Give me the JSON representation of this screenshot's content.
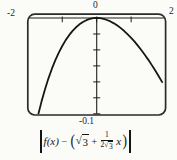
{
  "colors": {
    "ink": "#1f1f1f",
    "frame": "#2a2a2a",
    "background": "#fbfbf8"
  },
  "window_labels": {
    "top_left": "-2",
    "top_center": "0",
    "top_right": "2",
    "bottom": "-0.1"
  },
  "caption": {
    "bar": "|",
    "f_term": "f(x)",
    "minus": "−",
    "lparen": "(",
    "radical": "√",
    "radicand": "3",
    "plus": "+",
    "frac_num": "1",
    "frac_den_coeff": "2",
    "frac_den_radical": "√",
    "frac_den_radicand": "3",
    "x_var": "x",
    "rparen": ")"
  },
  "chart_data": {
    "type": "line",
    "xlabel": "",
    "ylabel": "",
    "xlim": [
      -2,
      2
    ],
    "ylim": [
      -0.1,
      0
    ],
    "grid": false,
    "legend_position": "none",
    "x_ticks": [
      -1,
      0,
      1
    ],
    "x_tick_labels_shown": [
      "-2",
      "0",
      "2"
    ],
    "y_tick_labels_shown": [
      "-0.1"
    ],
    "y_ticks": [
      -0.0167,
      -0.0333,
      -0.05,
      -0.0667,
      -0.0833,
      -0.1
    ],
    "series": [
      {
        "name": "error-curve",
        "x": [
          -1.7,
          -1.6,
          -1.5,
          -1.4,
          -1.3,
          -1.2,
          -1.1,
          -1.0,
          -0.9,
          -0.8,
          -0.7,
          -0.6,
          -0.5,
          -0.4,
          -0.3,
          -0.2,
          -0.1,
          0,
          0.1,
          0.2,
          0.3,
          0.4,
          0.5,
          0.6,
          0.7,
          0.8,
          0.9,
          1.0,
          1.1,
          1.2,
          1.3,
          1.4,
          1.5,
          1.6,
          1.7,
          1.8,
          1.9
        ],
        "y": [
          -0.1011,
          -0.087,
          -0.0743,
          -0.063,
          -0.0529,
          -0.044,
          -0.0361,
          -0.0292,
          -0.0231,
          -0.0179,
          -0.0134,
          -0.0097,
          -0.0066,
          -0.0041,
          -0.0023,
          -0.001,
          -0.0002,
          0,
          -0.0002,
          -0.0009,
          -0.0021,
          -0.0036,
          -0.0056,
          -0.0079,
          -0.0106,
          -0.0136,
          -0.017,
          -0.0207,
          -0.0247,
          -0.0291,
          -0.0337,
          -0.0386,
          -0.0437,
          -0.0492,
          -0.0549,
          -0.0608,
          -0.0669
        ]
      }
    ]
  }
}
